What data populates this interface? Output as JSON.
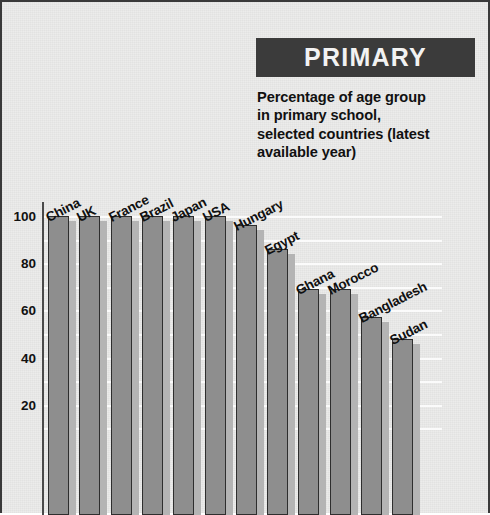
{
  "header": {
    "title": "PRIMARY",
    "subtitle_lines": [
      "Percentage of age group",
      "in primary school,",
      "selected countries (latest",
      "available year)"
    ],
    "title_bg_color": "#3b3b3b",
    "title_text_color": "#f2f2f2"
  },
  "chart_data": {
    "type": "bar",
    "title": "PRIMARY",
    "subtitle": "Percentage of age group in primary school, selected countries (latest available year)",
    "xlabel": "",
    "ylabel": "",
    "ylim": [
      0,
      105
    ],
    "grid": true,
    "grid_interval": 10,
    "legend": "none",
    "bar_color": "#8e8e8e",
    "bar_side_color": "#b4b4b4",
    "bar_outline_color": "#2e2e2e",
    "gridline_color": "#fbfbfb",
    "background_color": "#ececeb",
    "tick_labels": [
      "100",
      "80",
      "60",
      "40",
      "20"
    ],
    "tick_values": [
      100,
      80,
      60,
      40,
      20
    ],
    "categories": [
      "China",
      "UK",
      "France",
      "Brazil",
      "Japan",
      "USA",
      "Hungary",
      "Egypt",
      "Ghana",
      "Morocco",
      "Bangladesh",
      "Sudan"
    ],
    "values": [
      100,
      100,
      100,
      100,
      100,
      100,
      96,
      86,
      69,
      69,
      57,
      48
    ]
  }
}
